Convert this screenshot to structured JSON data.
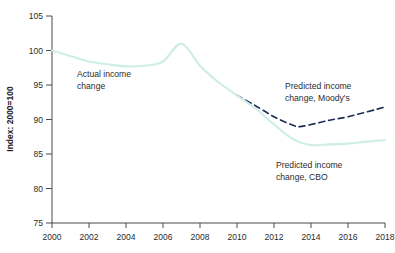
{
  "chart_data": {
    "type": "line",
    "title": "",
    "xlabel": "",
    "ylabel": "Index: 2000=100",
    "xlim": [
      2000,
      2018
    ],
    "ylim": [
      75,
      105
    ],
    "ytick_step": 5,
    "xtick_step": 2,
    "grid": false,
    "legend_position": "inline-annotations",
    "yticks": [
      "105",
      "100",
      "95",
      "90",
      "85",
      "80",
      "75"
    ],
    "xticks": [
      "2000",
      "2002",
      "2004",
      "2006",
      "2008",
      "2010",
      "2012",
      "2014",
      "2016",
      "2018"
    ],
    "series": [
      {
        "name": "Actual income change",
        "style": "solid",
        "color": "#cdeee6",
        "x": [
          2000,
          2001,
          2002,
          2003,
          2004,
          2005,
          2006,
          2007,
          2008,
          2009,
          2010
        ],
        "values": [
          100.0,
          99.2,
          98.4,
          98.0,
          97.7,
          97.8,
          98.4,
          101.0,
          97.8,
          95.4,
          93.5
        ]
      },
      {
        "name": "Predicted income change, Moody's",
        "style": "dashed",
        "color": "#1d2c52",
        "x": [
          2010,
          2011,
          2012,
          2013,
          2013.5,
          2015,
          2016,
          2018
        ],
        "values": [
          93.5,
          92.0,
          90.4,
          89.2,
          89.0,
          89.9,
          90.4,
          91.8
        ]
      },
      {
        "name": "Predicted income change, CBO",
        "style": "solid",
        "color": "#cdeee6",
        "x": [
          2010,
          2011,
          2012,
          2013,
          2014,
          2015,
          2016,
          2017,
          2018
        ],
        "values": [
          93.5,
          91.6,
          89.3,
          87.2,
          86.3,
          86.4,
          86.5,
          86.8,
          87.0
        ]
      }
    ],
    "annotations": [
      {
        "id": "actual",
        "lines": [
          "Actual income",
          "change"
        ],
        "x_px": 77,
        "y_px": 77
      },
      {
        "id": "moodys",
        "lines": [
          "Predicted income",
          "change, Moody's"
        ],
        "x_px": 285,
        "y_px": 89
      },
      {
        "id": "cbo",
        "lines": [
          "Predicted income",
          "change, CBO"
        ],
        "x_px": 276,
        "y_px": 168
      }
    ]
  }
}
